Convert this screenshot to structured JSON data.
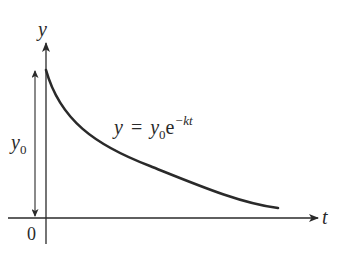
{
  "diagram": {
    "axes": {
      "y_label": "y",
      "x_label": "t",
      "origin_label": "0"
    },
    "initial_value": {
      "symbol": "y",
      "subscript": "0"
    },
    "equation": {
      "lhs": "y",
      "equals": "=",
      "coef": "y",
      "coef_sub": "0",
      "base": "e",
      "exponent": "−kt"
    },
    "colors": {
      "stroke": "#2a2a2a",
      "background": "#ffffff"
    }
  }
}
